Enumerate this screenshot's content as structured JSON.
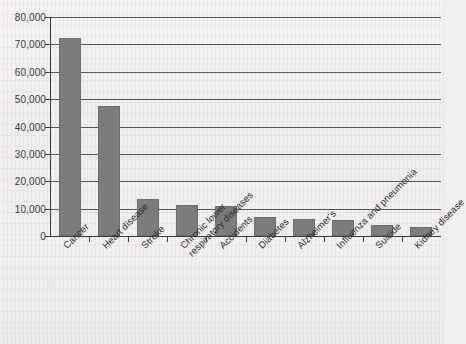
{
  "chart_data": {
    "type": "bar",
    "title": "",
    "subtitle": "",
    "xlabel": "",
    "ylabel": "",
    "categories": [
      "Cancer",
      "Heart disease",
      "Stroke",
      "Chronic lower\nrespiratory diseases",
      "Accidents",
      "Diabetes",
      "Alzheimer's",
      "Influenza and pneumonia",
      "Suicide",
      "Kidney disease"
    ],
    "values": [
      72500,
      47500,
      13500,
      11500,
      10800,
      7000,
      6300,
      5900,
      4000,
      3300
    ],
    "ylim": [
      0,
      80000
    ],
    "ytick_step": 10000,
    "ytick_labels": [
      "0",
      "10,000",
      "20,000",
      "30,000",
      "40,000",
      "50,000",
      "60,000",
      "70,000",
      "80,000"
    ],
    "ytick_values": [
      0,
      10000,
      20000,
      30000,
      40000,
      50000,
      60000,
      70000,
      80000
    ],
    "grid": true,
    "legend": false,
    "legend_position": "none",
    "bar_color": "#7c7c7c",
    "axis_color": "#3c3c3c",
    "background_color": "#f1f0ed"
  }
}
